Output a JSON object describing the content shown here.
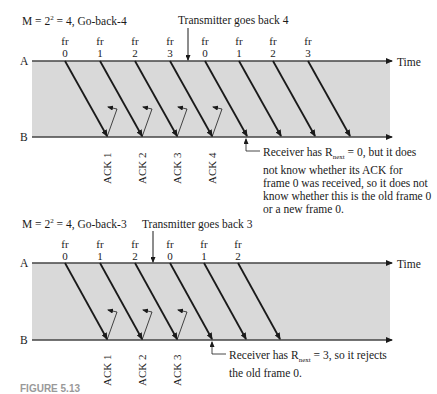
{
  "diagrams": [
    {
      "title_prefix": "M = 2",
      "title_exp": "2",
      "title_suffix": " = 4, Go-back-4",
      "transmitter_note": "Transmitter goes back 4",
      "station_a": "A",
      "station_b": "B",
      "time_label": "Time",
      "frames": [
        {
          "top": "fr",
          "num": "0"
        },
        {
          "top": "fr",
          "num": "1"
        },
        {
          "top": "fr",
          "num": "2"
        },
        {
          "top": "fr",
          "num": "3"
        },
        {
          "top": "fr",
          "num": "0"
        },
        {
          "top": "fr",
          "num": "1"
        },
        {
          "top": "fr",
          "num": "2"
        },
        {
          "top": "fr",
          "num": "3"
        }
      ],
      "acks": [
        "ACK 1",
        "ACK 2",
        "ACK 3",
        "ACK 4"
      ],
      "receiver_note": {
        "line1_prefix": "Receiver has R",
        "line1_sub": "next",
        "line1_suffix": " = 0, but it does",
        "line2": "not know whether its ACK for",
        "line3": "frame 0 was received, so it does not",
        "line4": "know whether this is the old frame 0",
        "line5": "or a new frame 0."
      }
    },
    {
      "title_prefix": "M = 2",
      "title_exp": "2",
      "title_suffix": " = 4, Go-back-3",
      "transmitter_note": "Transmitter goes back 3",
      "station_a": "A",
      "station_b": "B",
      "time_label": "Time",
      "frames": [
        {
          "top": "fr",
          "num": "0"
        },
        {
          "top": "fr",
          "num": "1"
        },
        {
          "top": "fr",
          "num": "2"
        },
        {
          "top": "fr",
          "num": "0"
        },
        {
          "top": "fr",
          "num": "1"
        },
        {
          "top": "fr",
          "num": "2"
        }
      ],
      "acks": [
        "ACK 1",
        "ACK 2",
        "ACK 3"
      ],
      "receiver_note": {
        "line1_prefix": "Receiver has R",
        "line1_sub": "next",
        "line1_suffix": " = 3, so it rejects",
        "line2": "the old frame 0."
      }
    }
  ],
  "colors": {
    "timeline_bg": "#d9d9d9",
    "line": "#1a1a1a",
    "axis": "#444444"
  },
  "caption": "FIGURE 5.13"
}
